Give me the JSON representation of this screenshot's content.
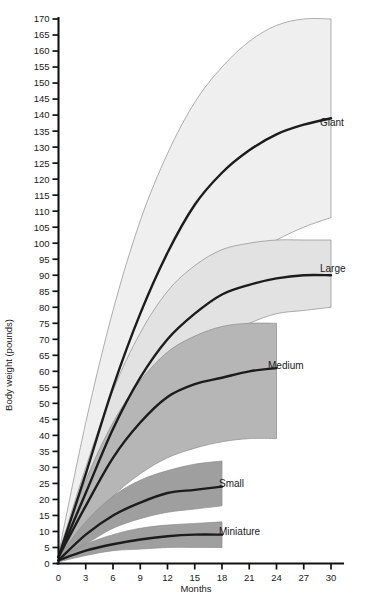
{
  "chart_data": {
    "type": "area",
    "title": "",
    "subtitle": "",
    "xlabel": "Months",
    "ylabel": "Body weight (pounds)",
    "xlim": [
      0,
      30
    ],
    "ylim": [
      0,
      170
    ],
    "xticks": [
      0,
      3,
      6,
      9,
      12,
      15,
      18,
      21,
      24,
      27,
      30
    ],
    "yticks": [
      0,
      5,
      10,
      15,
      20,
      25,
      30,
      35,
      40,
      45,
      50,
      55,
      60,
      65,
      70,
      75,
      80,
      85,
      90,
      95,
      100,
      105,
      110,
      115,
      120,
      125,
      130,
      135,
      140,
      145,
      150,
      155,
      160,
      165,
      170
    ],
    "grid": false,
    "legend_position": "inline-right",
    "x_unit": "months",
    "y_unit": "pounds",
    "series": [
      {
        "name": "Giant",
        "label": "Giant",
        "fill_color": "#efefef",
        "line_color": "#1c1c1c",
        "x_end": 30,
        "x": [
          0,
          3,
          6,
          9,
          12,
          15,
          18,
          21,
          24,
          27,
          30
        ],
        "median": [
          2,
          28,
          55,
          78,
          97,
          112,
          122,
          129,
          134,
          137,
          139
        ],
        "upper": [
          3,
          44,
          79,
          107,
          128,
          144,
          155,
          163,
          168,
          170,
          170
        ],
        "lower": [
          1,
          18,
          37,
          54,
          68,
          80,
          89,
          96,
          101,
          105,
          108
        ]
      },
      {
        "name": "Large",
        "label": "Large",
        "fill_color": "#e2e2e2",
        "line_color": "#1c1c1c",
        "x_end": 30,
        "x": [
          0,
          3,
          6,
          9,
          12,
          15,
          18,
          21,
          24,
          27,
          30
        ],
        "median": [
          2,
          22,
          42,
          58,
          70,
          78,
          84,
          87,
          89,
          90,
          90
        ],
        "upper": [
          3,
          30,
          54,
          72,
          85,
          93,
          98,
          100,
          101,
          101,
          101
        ],
        "lower": [
          1,
          15,
          31,
          45,
          56,
          65,
          71,
          75,
          78,
          79,
          80
        ]
      },
      {
        "name": "Medium",
        "label": "Medium",
        "fill_color": "#b6b6b6",
        "line_color": "#1c1c1c",
        "x_end": 24,
        "x": [
          0,
          3,
          6,
          9,
          12,
          15,
          18,
          21,
          24
        ],
        "median": [
          2,
          18,
          33,
          44,
          52,
          56,
          58,
          60,
          61
        ],
        "upper": [
          3,
          26,
          44,
          57,
          66,
          71,
          74,
          75,
          75
        ],
        "lower": [
          1,
          11,
          21,
          28,
          33,
          36,
          38,
          39,
          39
        ]
      },
      {
        "name": "Small",
        "label": "Small",
        "fill_color": "#9f9f9f",
        "line_color": "#1c1c1c",
        "x_end": 18,
        "x": [
          0,
          3,
          6,
          9,
          12,
          15,
          18
        ],
        "median": [
          1,
          9,
          15,
          19,
          22,
          23,
          24
        ],
        "upper": [
          2,
          13,
          21,
          26,
          29,
          31,
          32
        ],
        "lower": [
          1,
          6,
          11,
          14,
          16,
          17,
          18
        ]
      },
      {
        "name": "Miniature",
        "label": "Miniature",
        "fill_color": "#9f9f9f",
        "line_color": "#1c1c1c",
        "x_end": 18,
        "x": [
          0,
          3,
          6,
          9,
          12,
          15,
          18
        ],
        "median": [
          1,
          4,
          6,
          7.5,
          8.5,
          9,
          9
        ],
        "upper": [
          1.5,
          6,
          9,
          11,
          12,
          12.5,
          13
        ],
        "lower": [
          0.5,
          2.5,
          4,
          4.5,
          5,
          5,
          5
        ]
      }
    ]
  },
  "labels": {
    "giant": "Giant",
    "large": "Large",
    "medium": "Medium",
    "small": "Small",
    "miniature": "Miniature",
    "x_axis_title": "Months",
    "y_axis_title": "Body weight (pounds)"
  },
  "colors": {
    "giant_fill": "#efefef",
    "large_fill": "#e2e2e2",
    "medium_fill": "#b6b6b6",
    "small_fill": "#9f9f9f",
    "miniature_fill": "#9f9f9f",
    "line": "#1c1c1c",
    "axis": "#111111",
    "background": "#ffffff"
  }
}
